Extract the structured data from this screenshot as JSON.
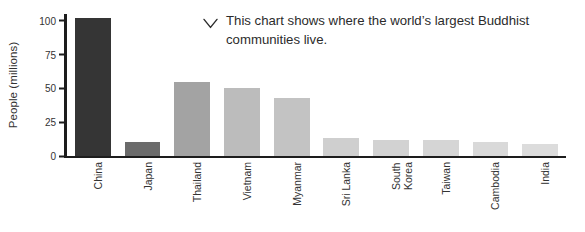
{
  "chart_data": {
    "type": "bar",
    "title": "",
    "subtitle": "",
    "xlabel": "",
    "ylabel": "People (millions)",
    "ylim": [
      0,
      105
    ],
    "yticks": [
      0,
      25,
      50,
      75,
      100
    ],
    "ytick_labels": [
      "0",
      "25",
      "50",
      "75",
      "100"
    ],
    "grid": false,
    "legend": false,
    "categories": [
      "China",
      "Japan",
      "Thailand",
      "Vietnam",
      "Myanmar",
      "Sri Lanka",
      "South\nKorea",
      "Taiwan",
      "Cambodia",
      "India"
    ],
    "values": [
      102,
      10,
      55,
      50,
      43,
      13,
      12,
      11.5,
      10,
      9
    ],
    "bar_colors": [
      "#353535",
      "#6b6b6b",
      "#a3a3a3",
      "#bcbcbc",
      "#c3c3c3",
      "#cfcfcf",
      "#d2d2d2",
      "#d5d5d5",
      "#d9d9d9",
      "#dcdcdc"
    ]
  },
  "annotation": {
    "icon": "chevron-down-icon",
    "text": "This chart shows where the world’s largest Buddhist communities live."
  },
  "colors": {
    "axis": "#1d1d1d",
    "text": "#333333",
    "background": "#ffffff"
  }
}
